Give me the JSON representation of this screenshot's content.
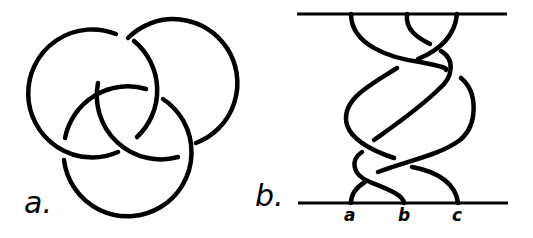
{
  "panels": [
    {
      "id": "a",
      "label": "a.",
      "description": "Borromean rings (three interlocked circles)"
    },
    {
      "id": "b",
      "label": "b.",
      "description": "Braid diagram of three strands between two horizontal bars",
      "strand_labels": [
        "a",
        "b",
        "c"
      ]
    }
  ],
  "colors": {
    "ink": "#000000",
    "background": "#ffffff"
  }
}
